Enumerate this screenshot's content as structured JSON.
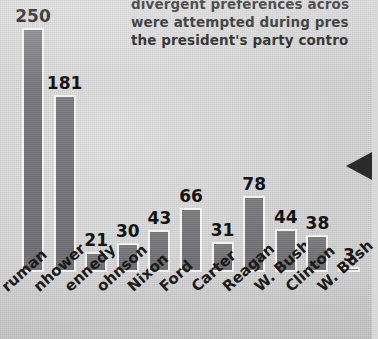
{
  "caption": {
    "lines": [
      "divergent preferences acros",
      "were attempted during pres",
      "the president's party contro"
    ]
  },
  "pointer": {
    "name": "triangle-pointer",
    "color": "#2b2b2b"
  },
  "colors": {
    "paper": "#d9d9d9",
    "bar_fill": "#78787a",
    "bar_outline": "#f2f2f0",
    "text": "#1a1a1a"
  },
  "chart_data": {
    "type": "bar",
    "title": "",
    "xlabel": "",
    "ylabel": "",
    "ylim": [
      0,
      250
    ],
    "grid": false,
    "legend": null,
    "categories": [
      "ruman",
      "nhower",
      "ennedy",
      "ohnson",
      "Nixon",
      "Ford",
      "Carter",
      "Reagan",
      "W. Bush",
      "Clinton",
      "W. Bush"
    ],
    "values": [
      250,
      181,
      21,
      30,
      43,
      66,
      31,
      78,
      44,
      38,
      3
    ],
    "data_labels": [
      "250",
      "181",
      "21",
      "30",
      "43",
      "66",
      "31",
      "78",
      "44",
      "38",
      "3"
    ]
  }
}
